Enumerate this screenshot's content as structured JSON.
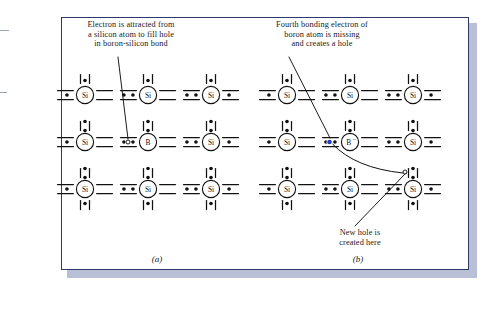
{
  "figure": {
    "type": "semiconductor-doping-diagram",
    "panels": [
      {
        "id": "a",
        "label": "(a)",
        "caption": "Electron is attracted from\na silicon atom to fill hole\nin boron-silicon bond",
        "caption_lines": [
          "Electron is attracted from",
          "a silicon atom to fill hole",
          "in boron-silicon bond"
        ],
        "atoms": [
          {
            "symbol": "Si",
            "row": 0,
            "col": 0
          },
          {
            "symbol": "Si",
            "row": 0,
            "col": 1
          },
          {
            "symbol": "Si",
            "row": 0,
            "col": 2
          },
          {
            "symbol": "Si",
            "row": 1,
            "col": 0
          },
          {
            "symbol": "B",
            "row": 1,
            "col": 1
          },
          {
            "symbol": "Si",
            "row": 1,
            "col": 2
          },
          {
            "symbol": "Si",
            "row": 2,
            "col": 0
          },
          {
            "symbol": "Si",
            "row": 2,
            "col": 1
          },
          {
            "symbol": "Si",
            "row": 2,
            "col": 2
          }
        ],
        "hole": {
          "row": 1,
          "bond": "left-of-boron",
          "style": "open-circle"
        },
        "pointer_line": {
          "from": "caption",
          "to": "hole"
        },
        "electron_color": "#000000",
        "hole_color": "#000000"
      },
      {
        "id": "b",
        "label": "(b)",
        "caption": "Fourth bonding electron of\nboron atom is missing\nand creates a hole",
        "caption_lines": [
          "Fourth bonding electron of",
          "boron atom is missing",
          "and creates a hole"
        ],
        "atoms": [
          {
            "symbol": "Si",
            "row": 0,
            "col": 0
          },
          {
            "symbol": "Si",
            "row": 0,
            "col": 1
          },
          {
            "symbol": "Si",
            "row": 0,
            "col": 2
          },
          {
            "symbol": "Si",
            "row": 1,
            "col": 0
          },
          {
            "symbol": "B⁻",
            "row": 1,
            "col": 1
          },
          {
            "symbol": "Si",
            "row": 1,
            "col": 2
          },
          {
            "symbol": "Si",
            "row": 2,
            "col": 0
          },
          {
            "symbol": "Si",
            "row": 2,
            "col": 1
          },
          {
            "symbol": "Si",
            "row": 2,
            "col": 2
          }
        ],
        "moved_electron": {
          "row": 1,
          "bond": "left-of-boron",
          "color": "#1f3fbf",
          "style": "filled-circle"
        },
        "hole": {
          "position": "upper-left of bottom-right silicon",
          "style": "open-circle"
        },
        "annotation": {
          "text": "New hole is\ncreated here",
          "lines": [
            "New hole is",
            "created here"
          ],
          "leader_line": true
        }
      }
    ],
    "atom_symbols": {
      "silicon": "Si",
      "boron": "B",
      "boron_ion": "B⁻"
    },
    "colors": {
      "frame_border": "#2b3a6b",
      "page_shadow": "#b9c0d6",
      "ink": "#111111",
      "moved_electron": "#1f3fbf",
      "background": "#ffffff"
    }
  }
}
